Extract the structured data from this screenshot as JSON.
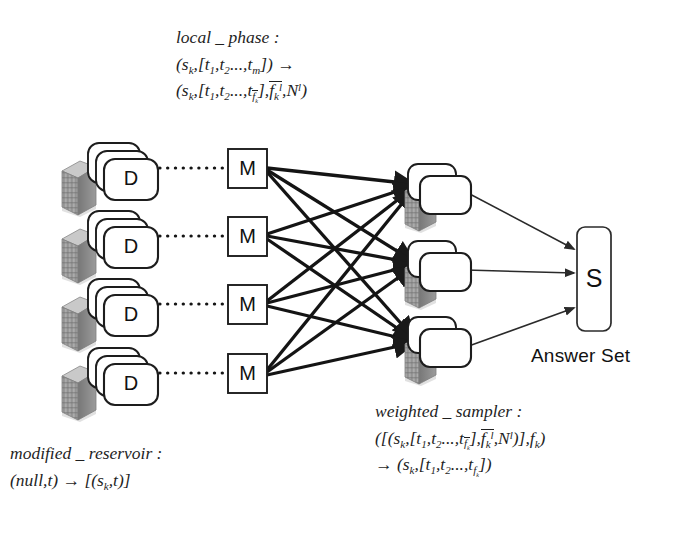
{
  "diagram": {
    "title_semantics": "distributed sampling pipeline",
    "background": "#ffffff",
    "stroke_color": "#1a1a1a",
    "node_fill": "#ffffff",
    "server_fill": "#9e9e9e",
    "server_shadow": "#bdbdbd"
  },
  "annotations": {
    "local_phase": {
      "name": "local_phase",
      "line1": "local _ phase :",
      "line2_plain": "(s_k, [t_1, t_2 ..., t_m]) →",
      "line3_plain": "(s_k, [t_1, t_2 ..., t_{\\bar f_k^l}], \\bar f_k^l, N^l)"
    },
    "modified_reservoir": {
      "name": "modified_reservoir",
      "line1": "modified _ reservoir :",
      "line2_plain": "(null, t) → [(s_k, t)]"
    },
    "weighted_sampler": {
      "name": "weighted_sampler",
      "line1": "weighted _ sampler :",
      "line2_plain": "([(s_k, [t_1, t_2 ..., t_{\\bar f_k^l}], \\bar f_k^l, N^l)], f_k)",
      "line3_plain": "→ (s_k, [t_1, t_2 ..., t_{f_k}])"
    },
    "answer_set_label": "Answer Set"
  },
  "nodes": {
    "data_nodes": [
      {
        "label": "D",
        "index": 1,
        "cx": 112,
        "cy": 168
      },
      {
        "label": "D",
        "index": 2,
        "cx": 112,
        "cy": 236
      },
      {
        "label": "D",
        "index": 3,
        "cx": 112,
        "cy": 304
      },
      {
        "label": "D",
        "index": 4,
        "cx": 112,
        "cy": 373
      }
    ],
    "mapper_nodes": [
      {
        "label": "M",
        "index": 1,
        "cx": 247,
        "cy": 168
      },
      {
        "label": "M",
        "index": 2,
        "cx": 247,
        "cy": 236
      },
      {
        "label": "M",
        "index": 3,
        "cx": 247,
        "cy": 304
      },
      {
        "label": "M",
        "index": 4,
        "cx": 247,
        "cy": 373
      }
    ],
    "reducer_nodes": [
      {
        "label": "",
        "index": 1,
        "cx": 434,
        "cy": 188
      },
      {
        "label": "",
        "index": 2,
        "cx": 434,
        "cy": 265
      },
      {
        "label": "",
        "index": 3,
        "cx": 434,
        "cy": 341
      }
    ],
    "sink_node": {
      "label": "S",
      "cx": 594,
      "cy": 279,
      "width": 34,
      "height": 104
    }
  },
  "edges": {
    "data_to_mapper_style": "dotted",
    "mapper_to_reducer_style": "thick-solid-arrow",
    "reducer_to_sink_style": "thin-solid-arrow",
    "data_to_mapper_count": 4,
    "mapper_to_reducer_count": 12,
    "reducer_to_sink_count": 3
  }
}
